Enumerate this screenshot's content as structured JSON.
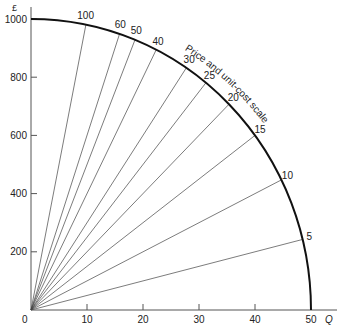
{
  "chart_data": {
    "type": "line",
    "title": "",
    "xlabel": "Q",
    "ylabel": "£",
    "xlim": [
      0,
      50
    ],
    "ylim": [
      0,
      1000
    ],
    "x_ticks": [
      0,
      10,
      20,
      30,
      40,
      50
    ],
    "y_ticks": [
      200,
      400,
      600,
      800,
      1000
    ],
    "grid": false,
    "arc_label": "Price and unit-cost scale",
    "rays": [
      {
        "price": 5
      },
      {
        "price": 10
      },
      {
        "price": 15
      },
      {
        "price": 20
      },
      {
        "price": 25
      },
      {
        "price": 30
      },
      {
        "price": 40
      },
      {
        "price": 50
      },
      {
        "price": 60
      },
      {
        "price": 100
      }
    ]
  },
  "axes": {
    "origin_label": "0",
    "x_axis_label": "Q",
    "y_axis_label": "£",
    "x_tick_labels": [
      "10",
      "20",
      "30",
      "40",
      "50"
    ],
    "y_tick_labels": [
      "200",
      "400",
      "600",
      "800",
      "1000"
    ]
  }
}
